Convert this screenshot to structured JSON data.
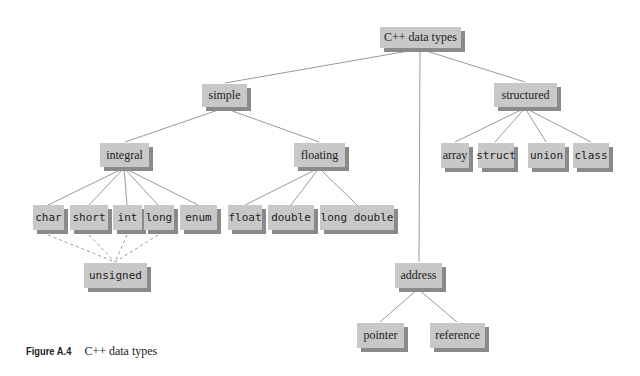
{
  "diagram": {
    "title": "C++ data types",
    "root": "C++ data types",
    "categories": {
      "simple": "simple",
      "structured": "structured",
      "address": "address"
    },
    "simple_children": {
      "integral": "integral",
      "floating": "floating"
    },
    "integral_types": [
      "char",
      "short",
      "int",
      "long",
      "enum"
    ],
    "integral_modifier": "unsigned",
    "floating_types": [
      "float",
      "double",
      "long double"
    ],
    "structured_types": [
      "array",
      "struct",
      "union",
      "class"
    ],
    "address_types": [
      "pointer",
      "reference"
    ]
  },
  "caption": {
    "label": "Figure A.4",
    "text": "C++ data types"
  },
  "colors": {
    "box_fill": "#c8c8c8",
    "box_shadow": "#8a8a8a",
    "line": "#9a9a9a"
  }
}
